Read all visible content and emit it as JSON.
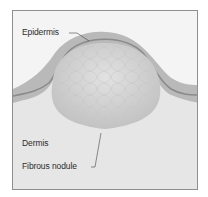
{
  "diagram": {
    "type": "anatomical-cross-section",
    "labels": {
      "epidermis": "Epidermis",
      "dermis": "Dermis",
      "nodule": "Fibrous nodule"
    },
    "colors": {
      "background": "#ececec",
      "frame_border": "#8f8f8f",
      "skin_layer": "#b9b9b9",
      "epidermis_line": "#8a8a8a",
      "nodule_fill": "#d3d3d3",
      "upper_area": "#f4f4f4"
    }
  }
}
